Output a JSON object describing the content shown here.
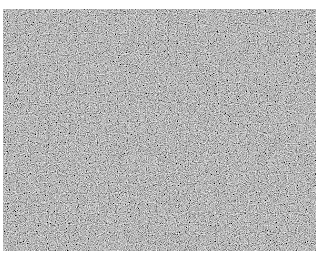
{
  "image": {
    "description": "grayscale random noise texture",
    "background_color": "#ffffff",
    "base_gray": "#7a7a7a"
  }
}
